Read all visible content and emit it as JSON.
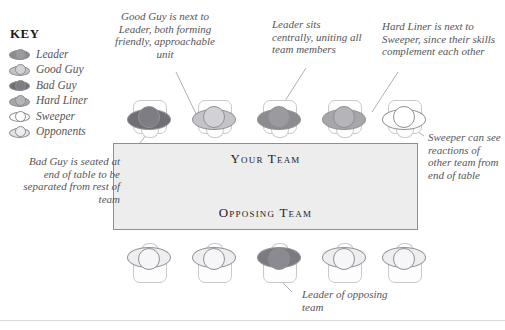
{
  "key": {
    "title": "KEY",
    "items": [
      {
        "label": "Leader",
        "fill": "#8b8b90",
        "head": "#9a9a9f"
      },
      {
        "label": "Good Guy",
        "fill": "#c4c4c8",
        "head": "#d2d2d6"
      },
      {
        "label": "Bad Guy",
        "fill": "#6f6f75",
        "head": "#7d7d83"
      },
      {
        "label": "Hard Liner",
        "fill": "#a6a6ab",
        "head": "#b4b4b9"
      },
      {
        "label": "Sweeper",
        "fill": "#ffffff",
        "head": "#ffffff"
      },
      {
        "label": "Opponents",
        "fill": "#e2e2e6",
        "head": "#ededf0"
      }
    ]
  },
  "table": {
    "top_label": "Your Team",
    "bottom_label": "Opposing Team",
    "fill": "#ededee",
    "border": "#8e8e93"
  },
  "your_team": [
    {
      "role": "Bad Guy",
      "fill": "#6f6f75",
      "head": "#7d7d83"
    },
    {
      "role": "Good Guy",
      "fill": "#c4c4c8",
      "head": "#d2d2d6"
    },
    {
      "role": "Leader",
      "fill": "#8b8b90",
      "head": "#9a9a9f"
    },
    {
      "role": "Hard Liner",
      "fill": "#a6a6ab",
      "head": "#b4b4b9"
    },
    {
      "role": "Sweeper",
      "fill": "#ffffff",
      "head": "#ffffff"
    }
  ],
  "opposing_team": [
    {
      "role": "Opponent",
      "fill": "#eeeef1",
      "head": "#f6f6f8"
    },
    {
      "role": "Opponent",
      "fill": "#eeeef1",
      "head": "#f6f6f8"
    },
    {
      "role": "Opposing Leader",
      "fill": "#7b7b81",
      "head": "#8a8a90"
    },
    {
      "role": "Opponent",
      "fill": "#eeeef1",
      "head": "#f6f6f8"
    },
    {
      "role": "Opponent",
      "fill": "#eeeef1",
      "head": "#f6f6f8"
    }
  ],
  "annotations": {
    "good_guy": "Good Guy is next to Leader, both forming friendly, approachable unit",
    "leader_central": "Leader sits centrally, uniting all team members",
    "hard_liner": "Hard Liner is next to Sweeper, since their skills complement each other",
    "sweeper": "Sweeper can see reactions of other team from end of table",
    "bad_guy": "Bad Guy is seated at end of table to be separated from rest of team",
    "opposing_leader": "Leader of opposing team"
  }
}
